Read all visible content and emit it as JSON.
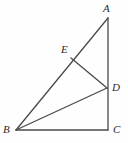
{
  "figure": {
    "kind": "geometry-diagram",
    "width": 128,
    "height": 143,
    "background_color": "#fefefe",
    "stroke_color": "#4a4a4a",
    "stroke_width": 1.3,
    "label_color": "#2b2b2b"
  },
  "points": [
    {
      "id": "A",
      "label": "A",
      "x": 108,
      "y": 18,
      "label_x": 103,
      "label_y": 3
    },
    {
      "id": "B",
      "label": "B",
      "x": 16,
      "y": 130,
      "label_x": 3,
      "label_y": 124
    },
    {
      "id": "C",
      "label": "C",
      "x": 108,
      "y": 130,
      "label_x": 113,
      "label_y": 124
    },
    {
      "id": "D",
      "label": "D",
      "x": 107,
      "y": 88,
      "label_x": 112,
      "label_y": 82
    },
    {
      "id": "E",
      "label": "E",
      "x": 71,
      "y": 58,
      "label_x": 61,
      "label_y": 44
    }
  ],
  "segments": [
    {
      "id": "AB",
      "from": "A",
      "to": "B",
      "name": "segment-ab"
    },
    {
      "id": "AC",
      "from": "A",
      "to": "C",
      "name": "segment-ac"
    },
    {
      "id": "BC",
      "from": "B",
      "to": "C",
      "name": "segment-bc"
    },
    {
      "id": "BD",
      "from": "B",
      "to": "D",
      "name": "segment-bd"
    },
    {
      "id": "ED",
      "from": "E",
      "to": "D",
      "name": "segment-ed"
    }
  ]
}
